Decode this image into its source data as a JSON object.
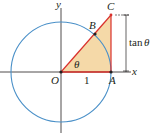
{
  "diagram": {
    "type": "unit-circle-tangent",
    "labels": {
      "y_axis": "y",
      "x_axis": "x",
      "origin": "O",
      "point_a": "A",
      "point_b": "B",
      "point_c": "C",
      "angle": "θ",
      "radius": "1",
      "tan_func": "tan",
      "tan_arg": "θ"
    },
    "colors": {
      "circle": "#4a90c8",
      "triangle_edge": "#d9302c",
      "triangle_fill": "#f5d9a8",
      "axes": "#231f20",
      "dimension_line": "#231f20"
    }
  }
}
